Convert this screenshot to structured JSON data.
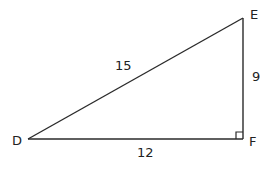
{
  "diagram": {
    "type": "right-triangle",
    "vertices": {
      "D": {
        "label": "D",
        "x": 28,
        "y": 139
      },
      "E": {
        "label": "E",
        "x": 243,
        "y": 18
      },
      "F": {
        "label": "F",
        "x": 243,
        "y": 139
      }
    },
    "sides": {
      "DE": {
        "label": "15"
      },
      "EF": {
        "label": "9"
      },
      "DF": {
        "label": "12"
      }
    },
    "right_angle_at": "F",
    "stroke_color": "#2a2a2a"
  }
}
